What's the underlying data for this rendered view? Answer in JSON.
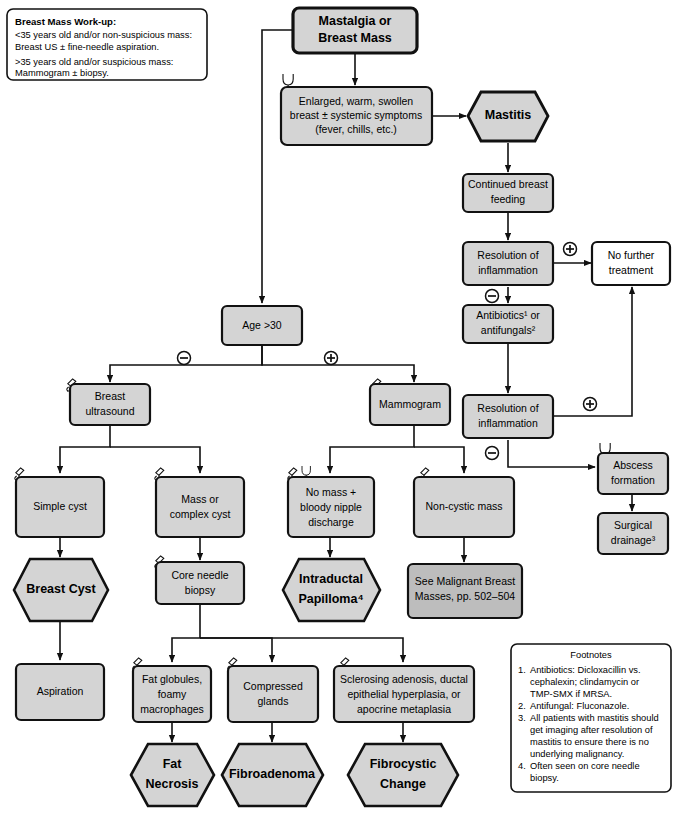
{
  "meta": {
    "colors": {
      "node_fill": "#d4d4d4",
      "node_fill_dark": "#bdbdbd",
      "node_fill_white": "#ffffff",
      "stroke": "#111111",
      "background": "#ffffff"
    }
  },
  "workup_note": {
    "heading": "Breast Mass Work-up:",
    "lines": [
      "<35 years old and/or non-suspicious mass:",
      "Breast US ± fine-needle aspiration.",
      ">35 years old and/or suspicious mass:",
      "Mammogram ± biopsy."
    ]
  },
  "nodes": {
    "start": {
      "label_lines": [
        "Mastalgia or",
        "Breast Mass"
      ],
      "shape": "rounded-rect",
      "style": "bold"
    },
    "enlarged": {
      "label_lines": [
        "Enlarged, warm, swollen",
        "breast ± systemic symptoms",
        "(fever, chills, etc.)"
      ],
      "shape": "rounded-rect",
      "icons": [
        "stethoscope-icon"
      ]
    },
    "mastitis": {
      "label_lines": [
        "Mastitis"
      ],
      "shape": "hexagon",
      "style": "bold"
    },
    "continued_feeding": {
      "label_lines": [
        "Continued breast",
        "feeding"
      ],
      "shape": "rounded-rect"
    },
    "resolution1": {
      "label_lines": [
        "Resolution of",
        "inflammation"
      ],
      "shape": "rounded-rect"
    },
    "no_further": {
      "label_lines": [
        "No further",
        "treatment"
      ],
      "shape": "rounded-rect",
      "fill": "white"
    },
    "antibiotics": {
      "label_lines": [
        "Antibiotics¹ or",
        "antifungals²"
      ],
      "shape": "rounded-rect"
    },
    "resolution2": {
      "label_lines": [
        "Resolution of",
        "inflammation"
      ],
      "shape": "rounded-rect"
    },
    "abscess": {
      "label_lines": [
        "Abscess",
        "formation"
      ],
      "shape": "rounded-rect",
      "icons": [
        "stethoscope-icon"
      ]
    },
    "surgical_drainage": {
      "label_lines": [
        "Surgical",
        "drainage³"
      ],
      "shape": "rounded-rect"
    },
    "age30": {
      "label_lines": [
        "Age >30"
      ],
      "shape": "rounded-rect"
    },
    "breast_us": {
      "label_lines": [
        "Breast",
        "ultrasound"
      ],
      "shape": "rounded-rect",
      "icons": [
        "microscope-icon"
      ]
    },
    "mammogram": {
      "label_lines": [
        "Mammogram"
      ],
      "shape": "rounded-rect",
      "icons": [
        "microscope-icon"
      ]
    },
    "simple_cyst": {
      "label_lines": [
        "Simple cyst"
      ],
      "shape": "rounded-rect",
      "icons": [
        "microscope-icon"
      ]
    },
    "mass_complex": {
      "label_lines": [
        "Mass or",
        "complex cyst"
      ],
      "shape": "rounded-rect",
      "icons": [
        "microscope-icon"
      ]
    },
    "no_mass_bloody": {
      "label_lines": [
        "No mass +",
        "bloody nipple",
        "discharge"
      ],
      "shape": "rounded-rect",
      "icons": [
        "microscope-icon",
        "stethoscope-icon"
      ]
    },
    "non_cystic": {
      "label_lines": [
        "Non-cystic mass"
      ],
      "shape": "rounded-rect",
      "icons": [
        "microscope-icon"
      ]
    },
    "breast_cyst": {
      "label_lines": [
        "Breast Cyst"
      ],
      "shape": "hexagon",
      "style": "bold"
    },
    "core_needle": {
      "label_lines": [
        "Core needle",
        "biopsy"
      ],
      "shape": "rounded-rect",
      "icons": [
        "microscope-icon"
      ]
    },
    "intraductal": {
      "label_lines": [
        "Intraductal",
        "Papilloma⁴"
      ],
      "shape": "hexagon",
      "style": "bold"
    },
    "see_malignant": {
      "label_lines": [
        "See Malignant Breast",
        "Masses, pp. 502–504"
      ],
      "shape": "rounded-rect",
      "fill": "dark"
    },
    "aspiration": {
      "label_lines": [
        "Aspiration"
      ],
      "shape": "rounded-rect"
    },
    "fat_globules": {
      "label_lines": [
        "Fat globules,",
        "foamy",
        "macrophages"
      ],
      "shape": "rounded-rect",
      "icons": [
        "microscope-icon"
      ]
    },
    "compressed_glands": {
      "label_lines": [
        "Compressed",
        "glands"
      ],
      "shape": "rounded-rect",
      "icons": [
        "microscope-icon"
      ]
    },
    "sclerosing": {
      "label_lines": [
        "Sclerosing adenosis, ductal",
        "epithelial hyperplasia, or",
        "apocrine metaplasia"
      ],
      "shape": "rounded-rect",
      "icons": [
        "microscope-icon"
      ]
    },
    "fat_necrosis": {
      "label_lines": [
        "Fat",
        "Necrosis"
      ],
      "shape": "hexagon",
      "style": "bold"
    },
    "fibroadenoma": {
      "label_lines": [
        "Fibroadenoma"
      ],
      "shape": "hexagon",
      "style": "bold"
    },
    "fibrocystic": {
      "label_lines": [
        "Fibrocystic",
        "Change"
      ],
      "shape": "hexagon",
      "style": "bold"
    }
  },
  "signs": {
    "plus": "⊕",
    "minus": "⊖",
    "resolution1_plus": "+",
    "resolution1_minus": "−",
    "resolution2_plus": "+",
    "resolution2_minus": "−",
    "age30_minus": "−",
    "age30_plus": "+"
  },
  "footnotes": {
    "title": "Footnotes",
    "items": [
      {
        "num": "1.",
        "lines": [
          "Antibiotics: Dicloxacillin vs.",
          "cephalexin; clindamycin or",
          "TMP-SMX if MRSA."
        ]
      },
      {
        "num": "2.",
        "lines": [
          "Antifungal: Fluconazole."
        ]
      },
      {
        "num": "3.",
        "lines": [
          "All patients with mastitis should",
          "get imaging after resolution of",
          "mastitis to ensure there is no",
          "underlying malignancy."
        ]
      },
      {
        "num": "4.",
        "lines": [
          "Often seen on core needle",
          "biopsy."
        ]
      }
    ]
  }
}
